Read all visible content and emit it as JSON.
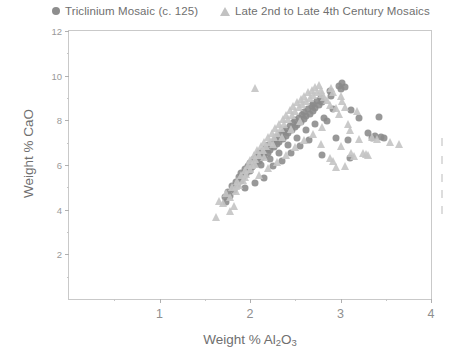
{
  "figure": {
    "background_color": "#ffffff",
    "frame_color": "#c9c9c9"
  },
  "legend": {
    "position": "top",
    "entries": [
      {
        "marker": "circle-marker",
        "label": "Triclinium Mosaic (c. 125)",
        "color": "#8a8a8a"
      },
      {
        "marker": "triangle-marker",
        "label": "Late 2nd to Late 4th Century Mosaics",
        "color": "#c4c4c4"
      }
    ]
  },
  "axes": {
    "x": {
      "title_prefix": "Weight % Al",
      "title_sub1": "2",
      "title_mid": "O",
      "title_sub2": "3",
      "ticks": [
        "1",
        "2",
        "3",
        "4"
      ],
      "range": [
        0,
        4
      ]
    },
    "y": {
      "title": "Weight % CaO",
      "ticks": [
        "2",
        "4",
        "6",
        "8",
        "10",
        "12"
      ],
      "range": [
        0,
        12
      ]
    }
  },
  "chart_data": {
    "type": "scatter",
    "title": "",
    "xlabel": "Weight % Al2O3",
    "ylabel": "Weight % CaO",
    "xlim": [
      0,
      4
    ],
    "ylim": [
      0,
      12
    ],
    "xticks": [
      1,
      2,
      3,
      4
    ],
    "yticks": [
      2,
      4,
      6,
      8,
      10,
      12
    ],
    "grid": false,
    "legend_position": "top",
    "series": [
      {
        "name": "Triclinium Mosaic (c. 125)",
        "marker": "circle",
        "color": "#8a8a8a",
        "points": [
          [
            1.72,
            4.55
          ],
          [
            1.74,
            4.35
          ],
          [
            1.76,
            4.8
          ],
          [
            1.78,
            4.62
          ],
          [
            1.8,
            5.05
          ],
          [
            1.82,
            4.9
          ],
          [
            1.84,
            5.25
          ],
          [
            1.86,
            5.1
          ],
          [
            1.88,
            5.45
          ],
          [
            1.9,
            5.3
          ],
          [
            1.9,
            5.62
          ],
          [
            1.92,
            5.48
          ],
          [
            1.94,
            5.8
          ],
          [
            1.96,
            5.6
          ],
          [
            1.98,
            5.95
          ],
          [
            2.0,
            5.75
          ],
          [
            2.0,
            6.1
          ],
          [
            2.02,
            5.92
          ],
          [
            2.04,
            6.25
          ],
          [
            2.06,
            6.05
          ],
          [
            2.08,
            6.38
          ],
          [
            2.1,
            6.18
          ],
          [
            2.1,
            6.52
          ],
          [
            2.12,
            6.3
          ],
          [
            2.14,
            6.62
          ],
          [
            2.16,
            6.42
          ],
          [
            2.18,
            6.75
          ],
          [
            2.2,
            6.55
          ],
          [
            2.2,
            6.88
          ],
          [
            2.22,
            6.68
          ],
          [
            2.24,
            7.0
          ],
          [
            2.26,
            6.8
          ],
          [
            2.28,
            7.12
          ],
          [
            2.3,
            6.92
          ],
          [
            2.3,
            7.25
          ],
          [
            2.32,
            7.05
          ],
          [
            2.34,
            7.38
          ],
          [
            2.36,
            7.18
          ],
          [
            2.38,
            7.5
          ],
          [
            2.4,
            7.3
          ],
          [
            2.4,
            7.62
          ],
          [
            2.42,
            7.42
          ],
          [
            2.44,
            7.75
          ],
          [
            2.46,
            7.55
          ],
          [
            2.48,
            7.88
          ],
          [
            2.5,
            7.68
          ],
          [
            2.5,
            8.0
          ],
          [
            2.52,
            7.8
          ],
          [
            2.54,
            8.12
          ],
          [
            2.56,
            7.92
          ],
          [
            2.58,
            8.25
          ],
          [
            2.6,
            8.05
          ],
          [
            2.6,
            8.38
          ],
          [
            2.62,
            8.18
          ],
          [
            2.64,
            8.5
          ],
          [
            2.66,
            8.3
          ],
          [
            2.68,
            8.62
          ],
          [
            2.7,
            8.42
          ],
          [
            2.7,
            8.75
          ],
          [
            2.72,
            8.55
          ],
          [
            2.74,
            8.88
          ],
          [
            2.76,
            8.68
          ],
          [
            2.78,
            9.0
          ],
          [
            2.8,
            8.8
          ],
          [
            2.8,
            6.45
          ],
          [
            2.85,
            7.95
          ],
          [
            2.88,
            9.3
          ],
          [
            2.9,
            9.1
          ],
          [
            2.92,
            8.5
          ],
          [
            2.95,
            7.2
          ],
          [
            2.98,
            9.55
          ],
          [
            3.0,
            9.4
          ],
          [
            3.02,
            9.65
          ],
          [
            3.05,
            9.5
          ],
          [
            3.08,
            7.1
          ],
          [
            3.1,
            6.3
          ],
          [
            3.12,
            8.45
          ],
          [
            3.2,
            8.1
          ],
          [
            3.3,
            7.45
          ],
          [
            3.35,
            7.2
          ],
          [
            3.38,
            7.3
          ],
          [
            3.42,
            8.15
          ],
          [
            3.45,
            7.25
          ],
          [
            3.48,
            7.2
          ],
          [
            2.15,
            5.4
          ],
          [
            2.25,
            5.95
          ],
          [
            2.35,
            6.2
          ],
          [
            2.45,
            6.55
          ],
          [
            2.55,
            6.85
          ],
          [
            2.65,
            7.1
          ],
          [
            2.05,
            5.2
          ],
          [
            1.95,
            4.95
          ],
          [
            2.12,
            6.02
          ],
          [
            2.22,
            6.28
          ],
          [
            2.32,
            6.55
          ],
          [
            2.42,
            6.9
          ],
          [
            2.52,
            7.22
          ],
          [
            2.62,
            7.55
          ],
          [
            2.72,
            7.85
          ],
          [
            2.82,
            8.1
          ]
        ]
      },
      {
        "name": "Late 2nd to Late 4th Century Mosaics",
        "marker": "triangle",
        "color": "#c4c4c4",
        "points": [
          [
            1.62,
            3.65
          ],
          [
            1.66,
            4.4
          ],
          [
            1.7,
            4.3
          ],
          [
            1.74,
            4.75
          ],
          [
            1.78,
            4.55
          ],
          [
            1.8,
            5.0
          ],
          [
            1.84,
            4.85
          ],
          [
            1.86,
            5.3
          ],
          [
            1.88,
            5.12
          ],
          [
            1.9,
            5.55
          ],
          [
            1.92,
            5.35
          ],
          [
            1.94,
            5.78
          ],
          [
            1.96,
            5.58
          ],
          [
            1.98,
            6.0
          ],
          [
            2.0,
            5.8
          ],
          [
            2.0,
            6.22
          ],
          [
            2.02,
            6.02
          ],
          [
            2.04,
            6.45
          ],
          [
            2.06,
            6.25
          ],
          [
            2.08,
            6.65
          ],
          [
            2.1,
            6.45
          ],
          [
            2.12,
            6.85
          ],
          [
            2.14,
            6.65
          ],
          [
            2.16,
            7.05
          ],
          [
            2.18,
            6.85
          ],
          [
            2.2,
            7.25
          ],
          [
            2.22,
            7.05
          ],
          [
            2.24,
            7.45
          ],
          [
            2.26,
            7.25
          ],
          [
            2.28,
            7.65
          ],
          [
            2.3,
            7.45
          ],
          [
            2.32,
            7.85
          ],
          [
            2.34,
            7.65
          ],
          [
            2.36,
            8.05
          ],
          [
            2.38,
            7.85
          ],
          [
            2.4,
            8.25
          ],
          [
            2.42,
            8.05
          ],
          [
            2.44,
            8.45
          ],
          [
            2.46,
            8.25
          ],
          [
            2.48,
            8.62
          ],
          [
            2.5,
            8.42
          ],
          [
            2.52,
            8.8
          ],
          [
            2.54,
            8.58
          ],
          [
            2.56,
            8.95
          ],
          [
            2.58,
            8.72
          ],
          [
            2.6,
            9.1
          ],
          [
            2.62,
            8.88
          ],
          [
            2.64,
            9.25
          ],
          [
            2.66,
            9.02
          ],
          [
            2.68,
            9.38
          ],
          [
            2.7,
            9.15
          ],
          [
            2.72,
            9.5
          ],
          [
            2.06,
            9.45
          ],
          [
            2.74,
            9.28
          ],
          [
            2.76,
            9.58
          ],
          [
            2.78,
            9.35
          ],
          [
            2.8,
            9.2
          ],
          [
            2.82,
            9.05
          ],
          [
            2.85,
            8.9
          ],
          [
            2.88,
            8.7
          ],
          [
            2.9,
            9.45
          ],
          [
            2.92,
            9.25
          ],
          [
            2.95,
            8.55
          ],
          [
            2.98,
            8.3
          ],
          [
            3.0,
            9.1
          ],
          [
            3.02,
            8.85
          ],
          [
            3.05,
            8.6
          ],
          [
            3.08,
            7.85
          ],
          [
            3.1,
            7.55
          ],
          [
            3.12,
            6.55
          ],
          [
            3.15,
            6.4
          ],
          [
            3.18,
            8.4
          ],
          [
            3.2,
            7.15
          ],
          [
            3.25,
            6.55
          ],
          [
            3.28,
            6.5
          ],
          [
            3.3,
            6.45
          ],
          [
            3.35,
            7.25
          ],
          [
            3.4,
            7.15
          ],
          [
            3.55,
            7.05
          ],
          [
            3.65,
            6.95
          ],
          [
            3.05,
            5.95
          ],
          [
            2.95,
            5.9
          ],
          [
            1.82,
            4.15
          ],
          [
            1.78,
            3.95
          ],
          [
            2.1,
            5.55
          ],
          [
            2.2,
            5.85
          ],
          [
            2.3,
            6.15
          ],
          [
            2.4,
            6.45
          ],
          [
            2.5,
            6.8
          ],
          [
            2.6,
            7.1
          ],
          [
            2.7,
            7.4
          ],
          [
            2.8,
            7.7
          ],
          [
            2.55,
            7.95
          ],
          [
            2.45,
            7.6
          ],
          [
            2.35,
            7.25
          ],
          [
            2.25,
            6.95
          ],
          [
            2.15,
            6.35
          ],
          [
            2.05,
            6.05
          ],
          [
            1.95,
            5.45
          ],
          [
            1.85,
            5.05
          ],
          [
            2.88,
            6.3
          ],
          [
            2.92,
            6.2
          ],
          [
            3.0,
            6.85
          ],
          [
            2.78,
            6.95
          ]
        ]
      }
    ]
  }
}
